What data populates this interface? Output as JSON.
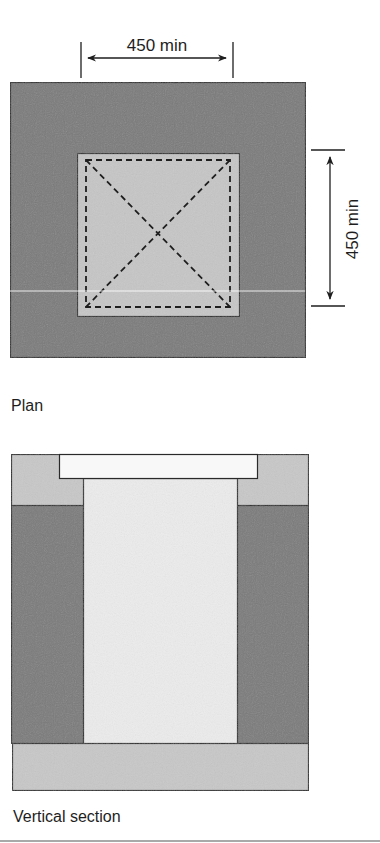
{
  "plan": {
    "caption": "Plan",
    "dimension_horizontal": "450 min",
    "dimension_vertical": "450 min"
  },
  "section": {
    "caption": "Vertical section"
  },
  "colors": {
    "dark_fill": "#7a7a7a",
    "mid_fill": "#c4c4c4",
    "light_fill": "#ededed",
    "cover_fill": "#f7f7f7",
    "stroke": "#2a2a2a"
  }
}
